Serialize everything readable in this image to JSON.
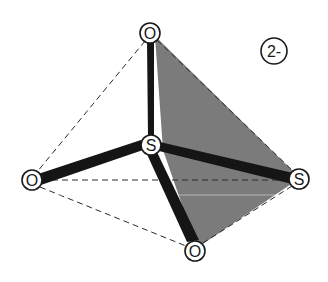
{
  "diagram": {
    "charge": "2-",
    "colors": {
      "face_fill": "#7b7b7b",
      "bond": "#151515",
      "outline": "#1a1a1a"
    },
    "atoms": [
      {
        "id": "O_top",
        "label": "O"
      },
      {
        "id": "S_center",
        "label": "S"
      },
      {
        "id": "O_left",
        "label": "O"
      },
      {
        "id": "S_right",
        "label": "S"
      },
      {
        "id": "O_bottom",
        "label": "O"
      }
    ],
    "bonds": [
      {
        "from": "S_center",
        "to": "O_top"
      },
      {
        "from": "S_center",
        "to": "O_left"
      },
      {
        "from": "S_center",
        "to": "S_right"
      },
      {
        "from": "S_center",
        "to": "O_bottom"
      }
    ],
    "tetrahedron_edges": [
      {
        "from": "O_top",
        "to": "O_left"
      },
      {
        "from": "O_left",
        "to": "S_right"
      },
      {
        "from": "O_left",
        "to": "O_bottom"
      },
      {
        "from": "O_top",
        "to": "S_right"
      },
      {
        "from": "S_right",
        "to": "O_bottom"
      }
    ],
    "shaded_face": [
      "O_top",
      "S_right",
      "O_bottom"
    ]
  }
}
